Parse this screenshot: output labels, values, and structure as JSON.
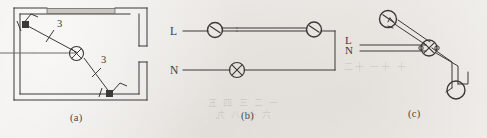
{
  "figure": {
    "panels": [
      {
        "id": "a",
        "caption": "(a)",
        "kind": "floor-plan",
        "description": "Room plan with two switches and one ceiling lamp",
        "labels": [
          "3",
          "3"
        ],
        "symbols": [
          "switch",
          "switch",
          "lamp"
        ]
      },
      {
        "id": "b",
        "caption": "(b)",
        "kind": "circuit-schematic",
        "line_labels": {
          "live": "L",
          "neutral": "N"
        },
        "symbols": [
          "switch",
          "switch",
          "lamp"
        ]
      },
      {
        "id": "c",
        "caption": "(c)",
        "kind": "isometric-wiring",
        "line_labels": {
          "live": "L",
          "neutral": "N"
        },
        "symbols": [
          "switch",
          "lamp",
          "switch"
        ]
      }
    ]
  },
  "colors": {
    "ink": "#3b3936",
    "ink_light": "#6d6a66",
    "paper": "#efedea",
    "wall_fill": "#c9c6c1"
  },
  "ghost_text": [
    "一 二 三 四 五",
    "六 七 八 九",
    "十 十一 十二"
  ]
}
